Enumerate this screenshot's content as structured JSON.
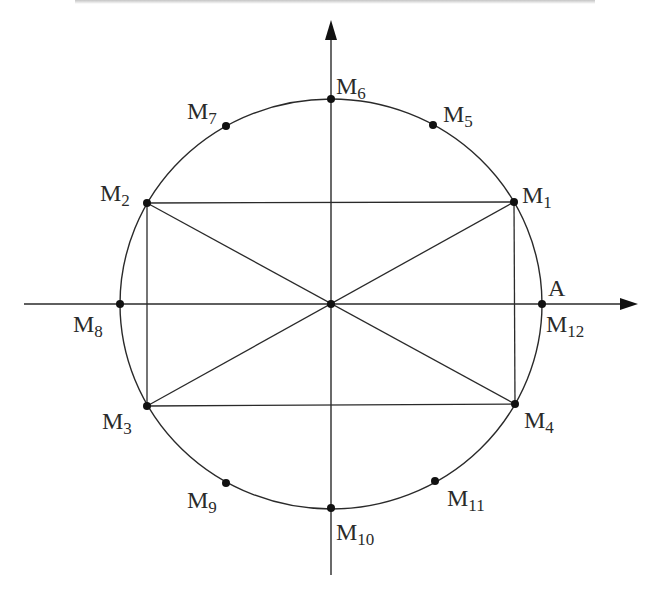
{
  "diagram": {
    "center": {
      "x": 331,
      "y": 304
    },
    "radius_x": 211,
    "radius_y": 205,
    "colors": {
      "stroke": "#2a2a2a",
      "point": "#111111",
      "background": "#ffffff"
    },
    "axes": {
      "horizontal": {
        "x1": 24,
        "y": 304,
        "x2": 638
      },
      "vertical": {
        "x": 331,
        "y1": 575,
        "y2": 20
      }
    },
    "points": [
      {
        "id": "M1",
        "base": "M",
        "sub": "1",
        "x": 514,
        "y": 202
      },
      {
        "id": "M2",
        "base": "M",
        "sub": "2",
        "x": 147,
        "y": 203
      },
      {
        "id": "M3",
        "base": "M",
        "sub": "3",
        "x": 147,
        "y": 406
      },
      {
        "id": "M4",
        "base": "M",
        "sub": "4",
        "x": 515,
        "y": 404
      },
      {
        "id": "M5",
        "base": "M",
        "sub": "5",
        "x": 433,
        "y": 125
      },
      {
        "id": "M6",
        "base": "M",
        "sub": "6",
        "x": 331,
        "y": 99
      },
      {
        "id": "M7",
        "base": "M",
        "sub": "7",
        "x": 226,
        "y": 126
      },
      {
        "id": "M8",
        "base": "M",
        "sub": "8",
        "x": 120,
        "y": 304
      },
      {
        "id": "M9",
        "base": "M",
        "sub": "9",
        "x": 226,
        "y": 483
      },
      {
        "id": "M10",
        "base": "M",
        "sub": "10",
        "x": 331,
        "y": 508
      },
      {
        "id": "M11",
        "base": "M",
        "sub": "11",
        "x": 435,
        "y": 481
      },
      {
        "id": "M12",
        "base": "M",
        "sub": "12",
        "x": 542,
        "y": 304
      },
      {
        "id": "O",
        "base": "",
        "sub": "",
        "x": 331,
        "y": 304
      }
    ],
    "labels": [
      {
        "base": "M",
        "sub": "1",
        "x": 522,
        "y": 183
      },
      {
        "base": "M",
        "sub": "2",
        "x": 100,
        "y": 181
      },
      {
        "base": "M",
        "sub": "3",
        "x": 102,
        "y": 409
      },
      {
        "base": "M",
        "sub": "4",
        "x": 524,
        "y": 408
      },
      {
        "base": "M",
        "sub": "5",
        "x": 443,
        "y": 102
      },
      {
        "base": "M",
        "sub": "6",
        "x": 336,
        "y": 74
      },
      {
        "base": "M",
        "sub": "7",
        "x": 187,
        "y": 99
      },
      {
        "base": "M",
        "sub": "8",
        "x": 73,
        "y": 312
      },
      {
        "base": "M",
        "sub": "9",
        "x": 187,
        "y": 488
      },
      {
        "base": "M",
        "sub": "10",
        "x": 336,
        "y": 520
      },
      {
        "base": "M",
        "sub": "11",
        "x": 447,
        "y": 486
      },
      {
        "base": "M",
        "sub": "12",
        "x": 546,
        "y": 312
      },
      {
        "base": "A",
        "sub": "",
        "x": 548,
        "y": 276
      }
    ],
    "segments": [
      {
        "from": "M1",
        "to": "M2"
      },
      {
        "from": "M2",
        "to": "M3"
      },
      {
        "from": "M3",
        "to": "M4"
      },
      {
        "from": "M4",
        "to": "M1"
      },
      {
        "from": "M1",
        "to": "M3"
      },
      {
        "from": "M2",
        "to": "M4"
      }
    ]
  }
}
